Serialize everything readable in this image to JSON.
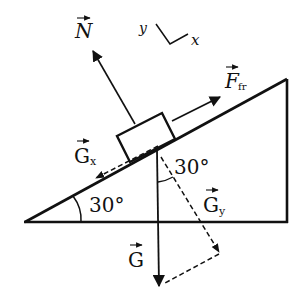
{
  "diagram": {
    "type": "free-body diagram on inclined plane",
    "labels": {
      "normal": "N",
      "friction": "F",
      "friction_sub": "fr",
      "gx": "G",
      "gx_sub": "x",
      "gy": "G",
      "gy_sub": "y",
      "gravity": "G",
      "incline_angle": "30°",
      "force_angle": "30°",
      "axis_y": "y",
      "axis_x": "x"
    },
    "colors": {
      "stroke": "#111111",
      "background": "#ffffff"
    }
  }
}
